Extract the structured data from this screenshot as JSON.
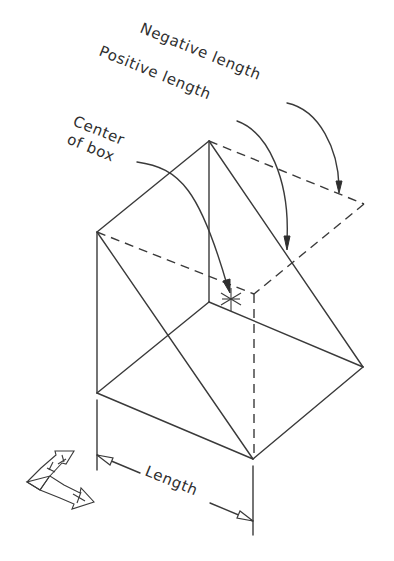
{
  "diagram": {
    "labels": {
      "negative_length": "Negative length",
      "positive_length": "Positive length",
      "center_line1": "Center",
      "center_line2": "of box",
      "length": "Length"
    },
    "ucs_icon": {
      "x_axis_label": "X",
      "y_axis_label": "Y"
    },
    "vertices": {
      "top": [
        209,
        141
      ],
      "left_top": [
        97,
        232
      ],
      "left_bottom": [
        97,
        393
      ],
      "bottom": [
        253,
        459
      ],
      "right_solid": [
        363,
        367
      ],
      "right_dashed": [
        364,
        204
      ],
      "back_inner": [
        209,
        302
      ],
      "front_dashed": [
        254,
        294
      ],
      "center_marker": [
        231,
        299
      ]
    },
    "colors": {
      "line": "#3a3a3a",
      "text": "#2e2e2e",
      "background": "#ffffff"
    }
  }
}
